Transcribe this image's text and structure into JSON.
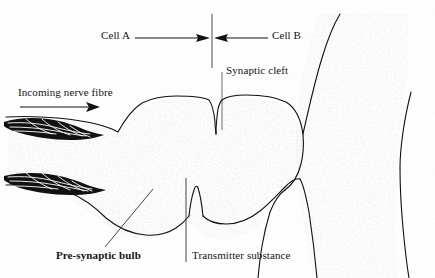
{
  "figure": {
    "background_color": "#ffffff",
    "ink_color": "#111111",
    "labels": {
      "cell_a": "Cell A",
      "cell_b": "Cell B",
      "synaptic_cleft": "Synaptic cleft",
      "incoming_nerve_fibre": "Incoming nerve fibre",
      "pre_synaptic_bulb": "Pre-synaptic bulb",
      "transmitter_substance": "Transmitter substance"
    },
    "icons": {
      "divider": "cell-boundary-divider-line",
      "left_arrow": "arrow-left-icon",
      "right_arrow": "arrow-right-icon",
      "flow_arrow": "arrow-right-icon",
      "fibre_bundle": "nerve-fibre-bundle-icon"
    },
    "annotations": [
      {
        "name": "cell-a-pointer",
        "text": "Cell A",
        "direction": "right"
      },
      {
        "name": "cell-b-pointer",
        "text": "Cell B",
        "direction": "left"
      },
      {
        "name": "synaptic-cleft-leader",
        "text": "Synaptic cleft"
      },
      {
        "name": "pre-synaptic-bulb-leader",
        "text": "Pre-synaptic bulb"
      },
      {
        "name": "transmitter-substance-leader",
        "text": "Transmitter substance"
      },
      {
        "name": "incoming-nerve-fibre-arrow",
        "text": "Incoming nerve fibre"
      }
    ]
  }
}
